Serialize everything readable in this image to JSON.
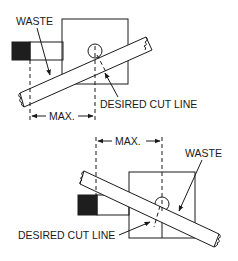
{
  "figure": {
    "top": {
      "waste_label": "WASTE",
      "cut_line_label": "DESIRED CUT LINE",
      "max_label": "MAX."
    },
    "bottom": {
      "waste_label": "WASTE",
      "cut_line_label": "DESIRED CUT LINE",
      "max_label": "MAX."
    }
  }
}
